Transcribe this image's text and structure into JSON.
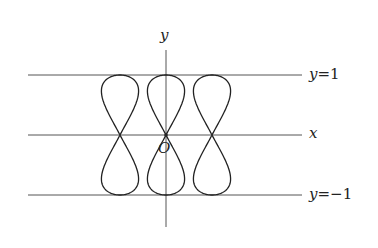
{
  "diagram": {
    "type": "parametric-curve-plot",
    "axes": {
      "x_label": "x",
      "y_label": "y",
      "origin_label": "O"
    },
    "reference_lines": [
      {
        "label_var": "y",
        "label_eq": "=",
        "label_val": "1",
        "value": 1
      },
      {
        "label_var": "y",
        "label_eq": "=",
        "label_val": "−1",
        "value": -1
      }
    ],
    "curves": [
      {
        "name": "figure-eight-left",
        "center_x_px": 120
      },
      {
        "name": "figure-eight-center",
        "center_x_px": 166
      },
      {
        "name": "figure-eight-right",
        "center_x_px": 212
      }
    ],
    "colors": {
      "line": "#444444",
      "curve": "#222222",
      "text": "#222222"
    }
  }
}
